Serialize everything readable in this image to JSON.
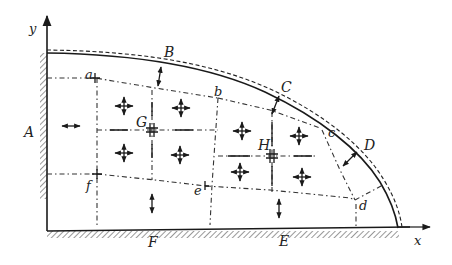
{
  "figure": {
    "type": "stress-field diagram of quarter-elliptical region fixed on two edges",
    "axes": {
      "x_label": "x",
      "y_label": "y"
    },
    "region_labels": {
      "A": "A",
      "B": "B",
      "C": "C",
      "D": "D",
      "E": "E",
      "F": "F",
      "G": "G",
      "H": "H"
    },
    "point_labels": {
      "a": "a",
      "b": "b",
      "c": "c",
      "d": "d",
      "e": "e",
      "f": "f"
    },
    "legend": {
      "solid_curve": "original boundary",
      "dashed_curve": "deformed boundary",
      "dash_dot_lines": "subregion divisions",
      "hatching": "fixed supports (left edge and bottom edge)"
    },
    "colors": {
      "ink": "#1a1a1a",
      "background": "#ffffff"
    }
  }
}
